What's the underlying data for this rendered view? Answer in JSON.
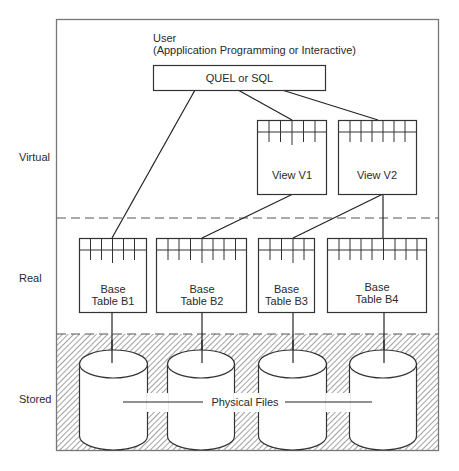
{
  "user": {
    "title": "User",
    "subtitle": "(Appplication Programming or Interactive)"
  },
  "query_language": {
    "label": "QUEL or SQL"
  },
  "layers": [
    {
      "id": "virtual",
      "label": "Virtual"
    },
    {
      "id": "real",
      "label": "Real"
    },
    {
      "id": "stored",
      "label": "Stored"
    }
  ],
  "views": [
    {
      "id": "v1",
      "label": "View V1"
    },
    {
      "id": "v2",
      "label": "View V2"
    }
  ],
  "base_tables": [
    {
      "id": "b1",
      "line1": "Base",
      "line2": "Table B1"
    },
    {
      "id": "b2",
      "line1": "Base",
      "line2": "Table B2"
    },
    {
      "id": "b3",
      "line1": "Base",
      "line2": "Table B3"
    },
    {
      "id": "b4",
      "line1": "Base",
      "line2": "Table B4"
    }
  ],
  "storage": {
    "label": "Physical Files",
    "count": 4
  },
  "connections": [
    [
      "QUEL or SQL",
      "Base Table B1"
    ],
    [
      "QUEL or SQL",
      "View V1"
    ],
    [
      "QUEL or SQL",
      "View V2"
    ],
    [
      "View V1",
      "Base Table B2"
    ],
    [
      "View V2",
      "Base Table B3"
    ],
    [
      "View V2",
      "Base Table B4"
    ],
    [
      "Base Table B1",
      "Physical File 1"
    ],
    [
      "Base Table B2",
      "Physical File 2"
    ],
    [
      "Base Table B3",
      "Physical File 3"
    ],
    [
      "Base Table B4",
      "Physical File 4"
    ]
  ]
}
